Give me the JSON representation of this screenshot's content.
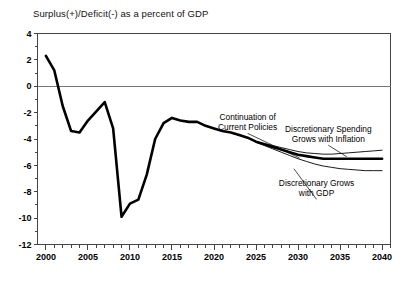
{
  "chart_data": {
    "type": "line",
    "title": "Surplus(+)/Deficit(-) as a percent of GDP",
    "xlabel": "",
    "ylabel": "",
    "xlim": [
      1999,
      2041
    ],
    "ylim": [
      -12,
      4
    ],
    "ytick_step": 2,
    "yticks": [
      4,
      2,
      0,
      -2,
      -4,
      -6,
      -8,
      -10,
      -12
    ],
    "ytick_labels": [
      "4",
      "2",
      "0",
      "-2",
      "-4",
      "-6",
      "-8",
      "-10",
      "-12"
    ],
    "xticks": [
      2000,
      2005,
      2010,
      2015,
      2020,
      2025,
      2030,
      2035,
      2040
    ],
    "xtick_labels": [
      "2000",
      "2005",
      "2010",
      "2015",
      "2020",
      "2025",
      "2030",
      "2035",
      "2040"
    ],
    "minor_xtick_interval": 1,
    "grid": false,
    "zero_line": true,
    "legend": "annotations",
    "annotations": [
      {
        "name": "continuation-of-current-policies",
        "text_lines": [
          "Continuation of",
          "Current Policies"
        ],
        "x_text": 2024.0,
        "y_text": -2.55,
        "leader_to_x": 2030.2,
        "leader_to_y": -5.45
      },
      {
        "name": "discretionary-spending-grows-with-inflation",
        "text_lines": [
          "Discretionary Spending",
          "Grows with Inflation"
        ],
        "x_text": 2033.6,
        "y_text": -3.45,
        "leader_to_x": 2035.8,
        "leader_to_y": -5.35
      },
      {
        "name": "discretionary-grows-with-gdp",
        "text_lines": [
          "Discretionary Grows",
          "with GDP"
        ],
        "x_text": 2032.2,
        "y_text": -7.55,
        "leader_to_x": 2029.5,
        "leader_to_y": -6.25
      }
    ],
    "series": [
      {
        "name": "Continuation of Current Policies",
        "style": "thick",
        "x": [
          2000,
          2001,
          2002,
          2003,
          2004,
          2005,
          2006,
          2007,
          2008,
          2009,
          2010,
          2011,
          2012,
          2013,
          2014,
          2015,
          2016,
          2017,
          2018,
          2019,
          2020,
          2021,
          2022,
          2023,
          2024,
          2025,
          2026,
          2027,
          2028,
          2029,
          2030,
          2031,
          2032,
          2033,
          2034,
          2035,
          2036,
          2037,
          2038,
          2039,
          2040
        ],
        "values": [
          2.3,
          1.2,
          -1.5,
          -3.4,
          -3.5,
          -2.6,
          -1.9,
          -1.2,
          -3.2,
          -9.9,
          -8.9,
          -8.6,
          -6.7,
          -4.0,
          -2.8,
          -2.4,
          -2.6,
          -2.7,
          -2.7,
          -3.0,
          -3.2,
          -3.4,
          -3.5,
          -3.7,
          -3.9,
          -4.2,
          -4.4,
          -4.6,
          -4.8,
          -5.0,
          -5.2,
          -5.3,
          -5.4,
          -5.5,
          -5.5,
          -5.5,
          -5.5,
          -5.5,
          -5.5,
          -5.5,
          -5.5
        ]
      },
      {
        "name": "Discretionary Spending Grows with Inflation",
        "style": "thin",
        "x": [
          2025,
          2026,
          2027,
          2028,
          2029,
          2030,
          2031,
          2032,
          2033,
          2034,
          2035,
          2036,
          2037,
          2038,
          2039,
          2040
        ],
        "values": [
          -4.2,
          -4.35,
          -4.5,
          -4.65,
          -4.8,
          -4.95,
          -5.05,
          -5.1,
          -5.15,
          -5.15,
          -5.1,
          -5.05,
          -5.0,
          -4.95,
          -4.9,
          -4.85
        ]
      },
      {
        "name": "Discretionary Grows with GDP",
        "style": "thin",
        "x": [
          2025,
          2026,
          2027,
          2028,
          2029,
          2030,
          2031,
          2032,
          2033,
          2034,
          2035,
          2036,
          2037,
          2038,
          2039,
          2040
        ],
        "values": [
          -4.25,
          -4.5,
          -4.75,
          -5.0,
          -5.25,
          -5.5,
          -5.7,
          -5.9,
          -6.05,
          -6.15,
          -6.25,
          -6.3,
          -6.35,
          -6.4,
          -6.4,
          -6.4
        ]
      }
    ]
  }
}
